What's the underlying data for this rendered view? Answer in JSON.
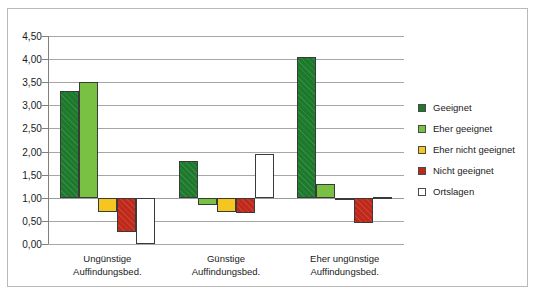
{
  "chart_data": {
    "type": "bar",
    "title": "",
    "xlabel": "",
    "ylabel": "",
    "ylim": [
      0.0,
      4.5
    ],
    "ytick_labels": [
      "4,50",
      "4,00",
      "3,50",
      "3,00",
      "2,50",
      "2,00",
      "1,50",
      "1,00",
      "0,50",
      "0,00"
    ],
    "ytick_values": [
      4.5,
      4.0,
      3.5,
      3.0,
      2.5,
      2.0,
      1.5,
      1.0,
      0.5,
      0.0
    ],
    "grid": true,
    "baseline": 1.0,
    "legend_position": "right",
    "categories": [
      "Ungünstige Auffindungsbed.",
      "Günstige Auffindungsbed.",
      "Eher ungünstige Auffindungsbed."
    ],
    "category_lines": [
      [
        "Ungünstige",
        "Auffindungsbed."
      ],
      [
        "Günstige",
        "Auffindungsbed."
      ],
      [
        "Eher ungünstige",
        "Auffindungsbed."
      ]
    ],
    "series": [
      {
        "name": "Geeignet",
        "color": "#1d7a2c",
        "values": [
          3.3,
          1.8,
          4.05
        ]
      },
      {
        "name": "Eher geeignet",
        "color": "#79c143",
        "values": [
          3.5,
          0.85,
          1.3
        ]
      },
      {
        "name": "Eher nicht geeignet",
        "color": "#f6c620",
        "values": [
          0.7,
          0.7,
          0.97
        ]
      },
      {
        "name": "Nicht geeignet",
        "color": "#c0281a",
        "values": [
          0.25,
          0.68,
          0.45
        ]
      },
      {
        "name": "Ortslagen",
        "color": "#ffffff",
        "values": [
          0.0,
          1.95,
          1.02
        ]
      }
    ]
  },
  "legend": {
    "items": [
      {
        "label": "Geeignet",
        "swatch": "#1d7a2c"
      },
      {
        "label": "Eher geeignet",
        "swatch": "#79c143"
      },
      {
        "label": "Eher nicht geeignet",
        "swatch": "#f6c620"
      },
      {
        "label": "Nicht geeignet",
        "swatch": "#c0281a"
      },
      {
        "label": "Ortslagen",
        "swatch": "#ffffff"
      }
    ]
  }
}
